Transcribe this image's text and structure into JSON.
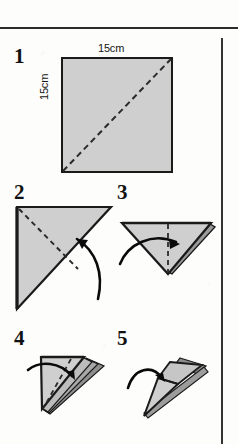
{
  "page": {
    "width": 238,
    "height": 444,
    "background_color": "#fdfdfc",
    "rule_color": "#2b2b2b"
  },
  "colors": {
    "paper_fill": "#cfcfcf",
    "paper_fill_light": "#dcdcdc",
    "paper_fill_dark": "#9a9a9a",
    "outline": "#1a1a1a",
    "fold_line": "#2a2a2a",
    "arrow": "#0a0a0a"
  },
  "steps": [
    {
      "number": "1",
      "name": "start-square",
      "shape": "square",
      "dimensions": {
        "top_label": "15cm",
        "left_label": "15cm"
      },
      "fold_line": "diagonal bottom-left to top-right",
      "arrow": false
    },
    {
      "number": "2",
      "name": "fold-triangle-corner",
      "shape": "right-triangle pointing down-left",
      "fold_line": "diagonal from top-left corner",
      "arrow": true,
      "arrow_direction": "up-left"
    },
    {
      "number": "3",
      "name": "fold-in-half-vertical",
      "shape": "inverted triangle",
      "fold_line": "vertical center",
      "arrow": true,
      "arrow_direction": "right"
    },
    {
      "number": "4",
      "name": "fold-layered-flap",
      "shape": "layered triangle flap",
      "fold_line": "diagonal",
      "arrow": true,
      "arrow_direction": "right-down"
    },
    {
      "number": "5",
      "name": "finished-shape",
      "shape": "narrow pointed layered form",
      "fold_line": "none",
      "arrow": true,
      "arrow_direction": "right"
    }
  ]
}
